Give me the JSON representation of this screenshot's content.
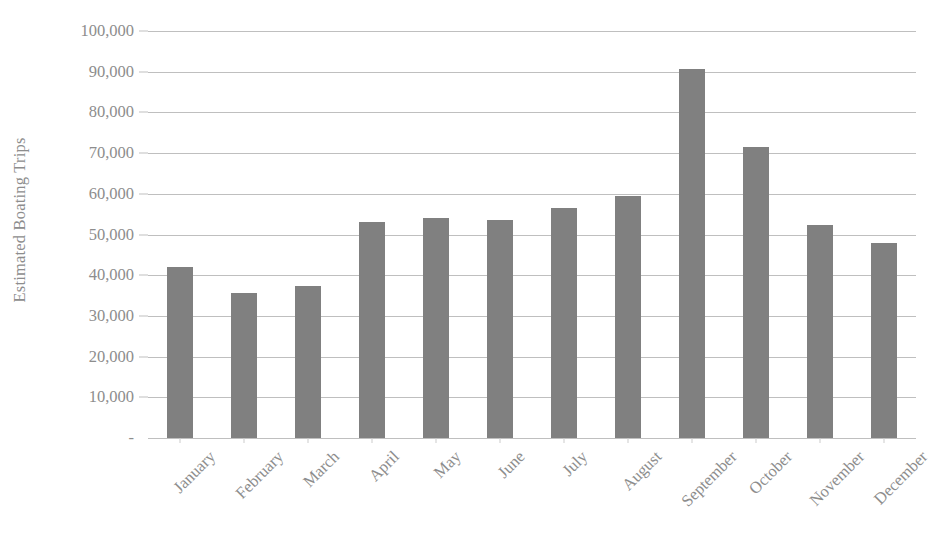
{
  "chart_data": {
    "type": "bar",
    "title": "",
    "xlabel": "",
    "ylabel": "Estimated Boating Trips",
    "categories": [
      "January",
      "February",
      "March",
      "April",
      "May",
      "June",
      "July",
      "August",
      "September",
      "October",
      "November",
      "December"
    ],
    "values": [
      42000,
      35600,
      37300,
      53100,
      54100,
      53600,
      56500,
      59500,
      90700,
      71500,
      52300,
      47900
    ],
    "ylim": [
      0,
      100000
    ],
    "ytick_labels": [
      "100,000",
      "90,000",
      "80,000",
      "70,000",
      "60,000",
      "50,000",
      "40,000",
      "30,000",
      "20,000",
      "10,000",
      "-"
    ],
    "ytick_values": [
      100000,
      90000,
      80000,
      70000,
      60000,
      50000,
      40000,
      30000,
      20000,
      10000,
      0
    ],
    "grid": true,
    "legend": false,
    "legend_position": "none",
    "bar_color": "#808080",
    "gridline_color": "#bfbfbf",
    "text_color": "#8d8d8d",
    "background_color": "#ffffff"
  }
}
